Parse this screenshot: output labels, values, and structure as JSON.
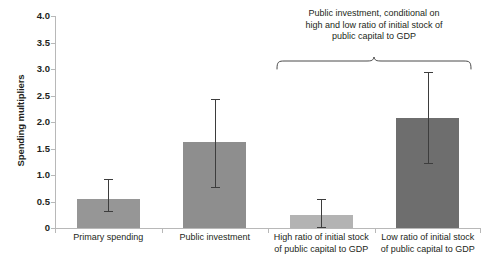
{
  "chart_data": {
    "type": "bar",
    "title": "",
    "subtitle": "",
    "xlabel": "",
    "ylabel": "Spending multipliers",
    "ylim": [
      0,
      4.0
    ],
    "yticks": [
      0,
      0.5,
      1.0,
      1.5,
      2.0,
      2.5,
      3.0,
      3.5,
      4.0
    ],
    "ytick_labels": [
      "0",
      "0.5",
      "1.0",
      "1.5",
      "2.0",
      "2.5",
      "3.0",
      "3.5",
      "4.0"
    ],
    "grid": false,
    "legend": "none",
    "categories": [
      "Primary spending",
      "Public investment",
      "High ratio of initial stock of public capital to GDP",
      "Low ratio of initial stock of public capital to GDP"
    ],
    "values": [
      0.55,
      1.62,
      0.25,
      2.08
    ],
    "error_low": [
      0.32,
      0.78,
      0.01,
      1.22
    ],
    "error_high": [
      0.93,
      2.43,
      0.55,
      2.95
    ],
    "bar_colors": [
      "#969696",
      "#8e8e8e",
      "#b3b3b3",
      "#6e6e6e"
    ],
    "error_color": "#3d3d3d",
    "axis_color": "#b8b8b8",
    "annotations": [
      {
        "text": "Public investment, conditional on high and low ratio of initial stock of public capital to GDP",
        "lines": [
          "Public investment, conditional on",
          "high and low ratio of initial stock of",
          "public capital to GDP"
        ],
        "covers": [
          2,
          3
        ],
        "shape": "curly-brace"
      }
    ]
  },
  "axis": {
    "y_title": "Spending multipliers"
  },
  "xlabels": [
    {
      "lines": [
        "Primary spending"
      ]
    },
    {
      "lines": [
        "Public investment"
      ]
    },
    {
      "lines": [
        "High ratio of initial stock",
        "of public capital to GDP"
      ]
    },
    {
      "lines": [
        "Low ratio of initial stock",
        "of public capital to GDP"
      ]
    }
  ]
}
